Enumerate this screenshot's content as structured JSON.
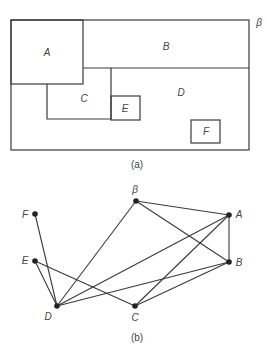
{
  "figure_a": {
    "caption": "(a)",
    "outer_label": "β",
    "regions": [
      {
        "id": "A",
        "label": "A"
      },
      {
        "id": "B",
        "label": "B"
      },
      {
        "id": "C",
        "label": "C"
      },
      {
        "id": "D",
        "label": "D"
      },
      {
        "id": "E",
        "label": "E"
      },
      {
        "id": "F",
        "label": "F"
      }
    ]
  },
  "figure_b": {
    "caption": "(b)",
    "nodes": [
      {
        "id": "beta",
        "label": "β",
        "x": 136,
        "y": 201
      },
      {
        "id": "A",
        "label": "A",
        "x": 229,
        "y": 215
      },
      {
        "id": "B",
        "label": "B",
        "x": 229,
        "y": 262
      },
      {
        "id": "C",
        "label": "C",
        "x": 135,
        "y": 306
      },
      {
        "id": "D",
        "label": "D",
        "x": 57,
        "y": 306
      },
      {
        "id": "E",
        "label": "E",
        "x": 35,
        "y": 261
      },
      {
        "id": "F",
        "label": "F",
        "x": 35,
        "y": 214
      }
    ],
    "edges": [
      [
        "beta",
        "A"
      ],
      [
        "beta",
        "B"
      ],
      [
        "beta",
        "D"
      ],
      [
        "A",
        "B"
      ],
      [
        "A",
        "D"
      ],
      [
        "A",
        "C"
      ],
      [
        "B",
        "D"
      ],
      [
        "B",
        "C"
      ],
      [
        "E",
        "D"
      ],
      [
        "E",
        "C"
      ],
      [
        "F",
        "D"
      ]
    ]
  }
}
